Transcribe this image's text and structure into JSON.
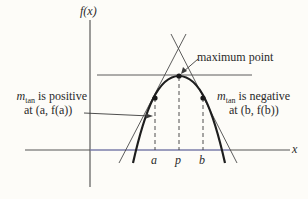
{
  "diagram": {
    "y_axis_label": "f(x)",
    "x_axis_label": "x",
    "annotations": {
      "maximum": "maximum point",
      "left": {
        "m": "m",
        "sub": "tan",
        "line1_rest": " is positive",
        "line2": "at (a, f(a))"
      },
      "right": {
        "m": "m",
        "sub": "tan",
        "line1_rest": " is negative",
        "line2": "at (b, f(b))"
      }
    },
    "tick_labels": {
      "a": "a",
      "p": "p",
      "b": "b"
    },
    "colors": {
      "ink": "#2a2a2a",
      "axis_tint": "#7b7fd6",
      "background": "#fdfcf8"
    }
  }
}
